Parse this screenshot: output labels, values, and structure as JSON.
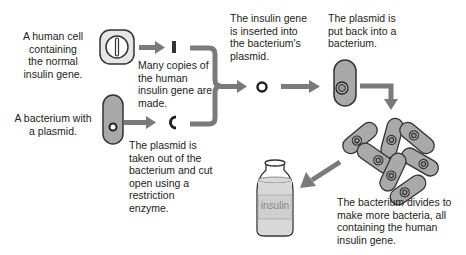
{
  "diagram": {
    "steps": {
      "human_cell": "A human cell containing the normal insulin gene.",
      "human_cell_lines": [
        "A human cell",
        "containing",
        "the normal",
        "insulin gene."
      ],
      "copies": "Many copies of the human insulin gene are made.",
      "copies_lines": [
        "Many copies of",
        "the human",
        "insulin gene are",
        "made."
      ],
      "bacterium": "A bacterium with a plasmid.",
      "bacterium_lines": [
        "A bacterium with",
        "a plasmid."
      ],
      "cut_plasmid": "The plasmid is taken out of the bacterium and cut open using a restriction enzyme.",
      "cut_plasmid_lines": [
        "The plasmid is",
        "taken out of the",
        "bacterium and cut",
        "open using a",
        "restriction",
        "enzyme."
      ],
      "inserted": "The insulin gene is inserted into the bacterium's plasmid.",
      "inserted_lines": [
        "The insulin gene",
        "is inserted into",
        "the bacterium's",
        "plasmid."
      ],
      "put_back": "The plasmid is put back into a bacterium.",
      "put_back_lines": [
        "The plasmid is",
        "put back into a",
        "bacterium."
      ],
      "divides": "The bacterium divides to make more bacteria, all containing the human insulin gene.",
      "divides_lines": [
        "The bacterium divides to",
        "make more bacteria, all",
        "containing the human",
        "insulin gene."
      ]
    },
    "bottle_label": "insulin",
    "colors": {
      "arrow": "#7a7a7a",
      "bacterium_fill": "#a9a9a9",
      "bacterium_stroke": "#3a3a3a",
      "cell_fill": "#e6e6e6",
      "text": "#222222"
    }
  }
}
